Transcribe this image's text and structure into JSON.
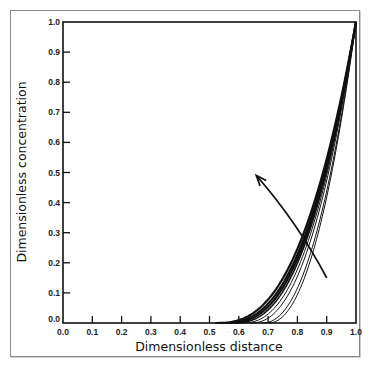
{
  "chart_data": {
    "type": "line",
    "title": "",
    "xlabel": "Dimensionless distance",
    "ylabel": "Dimensionless concentration",
    "xlim": [
      0.0,
      1.0
    ],
    "ylim": [
      0.0,
      1.0
    ],
    "grid": false,
    "legend": null,
    "x_ticks": [
      "0.0",
      "0.1",
      "0.2",
      "0.3",
      "0.4",
      "0.5",
      "0.6",
      "0.7",
      "0.8",
      "0.9",
      "1.0"
    ],
    "y_ticks": [
      "0.0",
      "0.1",
      "0.2",
      "0.3",
      "0.4",
      "0.5",
      "0.6",
      "0.7",
      "0.8",
      "0.9",
      "1.0"
    ],
    "series": [
      {
        "name": "curve-1",
        "x_start": 0.52,
        "exponent": 2.6,
        "weight": "thick"
      },
      {
        "name": "curve-2",
        "x_start": 0.54,
        "exponent": 2.6,
        "weight": "thick"
      },
      {
        "name": "curve-3",
        "x_start": 0.56,
        "exponent": 2.55,
        "weight": "thick"
      },
      {
        "name": "curve-4",
        "x_start": 0.58,
        "exponent": 2.5,
        "weight": "medium"
      },
      {
        "name": "curve-5",
        "x_start": 0.61,
        "exponent": 2.4,
        "weight": "thin"
      },
      {
        "name": "curve-6",
        "x_start": 0.64,
        "exponent": 2.3,
        "weight": "thin"
      },
      {
        "name": "curve-7",
        "x_start": 0.68,
        "exponent": 2.2,
        "weight": "thin"
      },
      {
        "name": "curve-8",
        "x_start": 0.7,
        "exponent": 2.15,
        "weight": "thin"
      }
    ],
    "curve_endpoint": {
      "x": 1.0,
      "y": 1.0
    },
    "annotations": [
      {
        "type": "arrow",
        "from": {
          "x": 0.9,
          "y": 0.15
        },
        "to": {
          "x": 0.66,
          "y": 0.49
        },
        "meaning": "direction of curve progression"
      }
    ]
  }
}
